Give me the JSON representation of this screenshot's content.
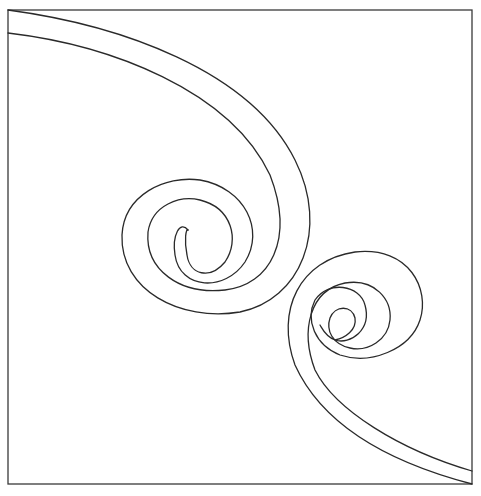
{
  "artwork": {
    "title": "Double spiral coloring outline",
    "stroke_color": "#2a2a2a",
    "frame_color": "#3a3a3a",
    "background_color": "#ffffff",
    "elements": [
      {
        "name": "upper-left-spiral",
        "description": "Spiral band sweeping from top-left corner curling clockwise into center-left"
      },
      {
        "name": "lower-right-spiral",
        "description": "Spiral band sweeping from bottom-right corner curling into center-right"
      }
    ]
  }
}
